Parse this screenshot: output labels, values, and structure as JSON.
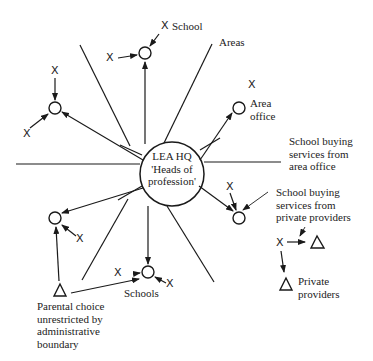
{
  "diagram": {
    "hub": {
      "line1": "LEA HQ",
      "line2": "'Heads of",
      "line3": "profession'"
    },
    "labels": {
      "top_school": "School",
      "areas": "Areas",
      "area_office_line1": "Area",
      "area_office_line2": "office",
      "buying_area_line1": "School buying",
      "buying_area_line2": "services from",
      "buying_area_line3": "area office",
      "buying_private_line1": "School buying",
      "buying_private_line2": "services from",
      "buying_private_line3": "private providers",
      "private_line1": "Private",
      "private_line2": "providers",
      "schools": "Schools",
      "parental_line1": "Parental choice",
      "parental_line2": "unrestricted by",
      "parental_line3": "administrative",
      "parental_line4": "boundary"
    },
    "symbols": {
      "x": "X"
    },
    "colors": {
      "ink": "#1a1a1a",
      "background": "#ffffff"
    }
  }
}
